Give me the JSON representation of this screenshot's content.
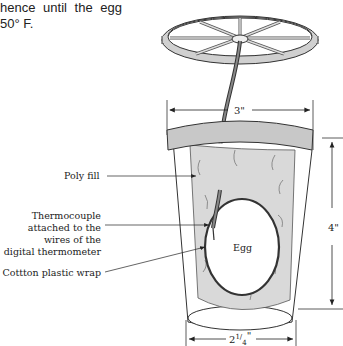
{
  "intro_text": {
    "line1": "hence  until  the  egg",
    "line2": "50° F."
  },
  "labels": {
    "poly_fill": "Poly fill",
    "thermo_1": "Thermocouple",
    "thermo_2": "attached to the",
    "thermo_3": "wires of the",
    "thermo_4": "digital thermometer",
    "wrap": "Cottton plastic wrap",
    "egg": "Egg"
  },
  "dimensions": {
    "top_width": "3\"",
    "height": "4\"",
    "bottom_whole": "2",
    "bottom_num": "1",
    "bottom_den": "4",
    "bottom_unit": "\""
  },
  "colors": {
    "fill_gray": "#d9d9d9",
    "band_gray": "#c8c8c8",
    "line": "#333333"
  }
}
